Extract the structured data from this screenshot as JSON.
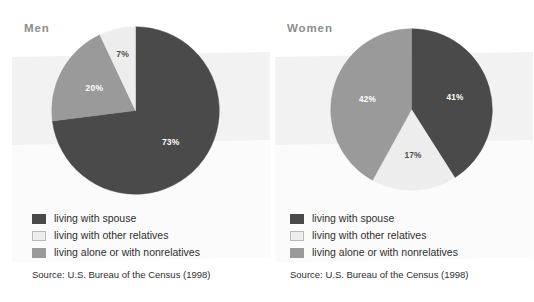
{
  "figure": {
    "background_color": "#ffffff",
    "panel_color": "#f2f2f2"
  },
  "palette": {
    "spouse": "#4a4a4a",
    "other_relatives": "#ededed",
    "alone_or_nonrelatives": "#9a9a9a"
  },
  "panels": [
    {
      "title": "Men",
      "legend": [
        {
          "swatch": "spouse-swatch",
          "label": "living with spouse"
        },
        {
          "swatch": "other-relatives-swatch",
          "label": "living with other relatives"
        },
        {
          "swatch": "alone-nonrelatives-swatch",
          "label": "living alone or with nonrelatives"
        }
      ],
      "source": "Source: U.S. Bureau of the Census (1998)"
    },
    {
      "title": "Women",
      "legend": [
        {
          "swatch": "spouse-swatch",
          "label": "living with spouse"
        },
        {
          "swatch": "other-relatives-swatch",
          "label": "living with other relatives"
        },
        {
          "swatch": "alone-nonrelatives-swatch",
          "label": "living alone or with nonrelatives"
        }
      ],
      "source": "Source: U.S. Bureau of the Census (1998)"
    }
  ],
  "chart_data": [
    {
      "type": "pie",
      "title": "Men",
      "labels": [
        "living with spouse",
        "living alone or with nonrelatives",
        "living with other relatives"
      ],
      "values": [
        73,
        20,
        7
      ],
      "value_labels": [
        "73%",
        "20%",
        "7%"
      ],
      "colors": [
        "#4a4a4a",
        "#9a9a9a",
        "#ededed"
      ],
      "start_angle_deg": 0,
      "direction": "clockwise",
      "legend_position": "bottom",
      "grid": false,
      "source": "Source: U.S. Bureau of the Census (1998)"
    },
    {
      "type": "pie",
      "title": "Women",
      "labels": [
        "living with spouse",
        "living with other relatives",
        "living alone or with nonrelatives"
      ],
      "values": [
        41,
        17,
        42
      ],
      "value_labels": [
        "41%",
        "17%",
        "42%"
      ],
      "colors": [
        "#4a4a4a",
        "#ededed",
        "#9a9a9a"
      ],
      "start_angle_deg": 0,
      "direction": "clockwise",
      "legend_position": "bottom",
      "grid": false,
      "source": "Source: U.S. Bureau of the Census (1998)"
    }
  ]
}
